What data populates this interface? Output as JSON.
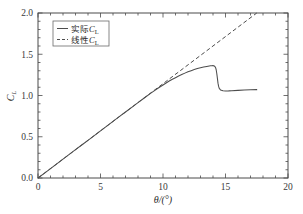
{
  "chart_data": {
    "type": "line",
    "title": "",
    "subtitle": "",
    "xlabel": "θ/(°)",
    "ylabel": "C",
    "ylabel_sub": "L",
    "xlim": [
      0,
      20
    ],
    "ylim": [
      0.0,
      2.0
    ],
    "xticks": [
      0,
      5,
      10,
      15,
      20
    ],
    "xticklabels": [
      "0",
      "5",
      "10",
      "15",
      "20"
    ],
    "yticks": [
      0.0,
      0.5,
      1.0,
      1.5,
      2.0
    ],
    "yticklabels": [
      "0.0",
      "0.5",
      "1.0",
      "1.5",
      "2.0"
    ],
    "x_minor_step": 1,
    "y_minor_step": 0.1,
    "grid": false,
    "legend_position": "upper-left",
    "series": [
      {
        "name": "实际C",
        "name_sub": "L",
        "style": "solid",
        "color": "#4d4d4d",
        "x": [
          0.0,
          0.5,
          1.0,
          1.5,
          2.0,
          2.5,
          3.0,
          3.5,
          4.0,
          4.5,
          5.0,
          5.5,
          6.0,
          6.5,
          7.0,
          7.5,
          8.0,
          8.5,
          9.0,
          9.5,
          10.0,
          10.25,
          10.5,
          10.75,
          11.0,
          11.25,
          11.5,
          11.75,
          12.0,
          12.25,
          12.5,
          12.75,
          13.0,
          13.25,
          13.5,
          13.6,
          13.7,
          13.8,
          13.9,
          14.0,
          14.1,
          14.2,
          14.25,
          14.3,
          14.35,
          14.4,
          14.45,
          14.5,
          14.6,
          14.8,
          15.0,
          15.25,
          15.5,
          16.0,
          16.5,
          17.0,
          17.5
        ],
        "y": [
          0.0,
          0.057,
          0.114,
          0.171,
          0.229,
          0.286,
          0.343,
          0.4,
          0.457,
          0.514,
          0.571,
          0.629,
          0.686,
          0.743,
          0.8,
          0.857,
          0.914,
          0.97,
          1.025,
          1.078,
          1.128,
          1.152,
          1.175,
          1.196,
          1.216,
          1.236,
          1.254,
          1.271,
          1.287,
          1.301,
          1.314,
          1.326,
          1.336,
          1.345,
          1.352,
          1.355,
          1.358,
          1.36,
          1.361,
          1.362,
          1.358,
          1.34,
          1.315,
          1.27,
          1.21,
          1.15,
          1.11,
          1.086,
          1.068,
          1.058,
          1.055,
          1.056,
          1.058,
          1.062,
          1.066,
          1.069,
          1.071
        ]
      },
      {
        "name": "线性C",
        "name_sub": "L",
        "style": "dashed",
        "color": "#4d4d4d",
        "x": [
          0.0,
          17.5
        ],
        "y": [
          0.0,
          2.0
        ]
      }
    ]
  },
  "legend": {
    "entries": [
      {
        "label_main": "实际",
        "label_var": "C",
        "label_sub": "L",
        "style": "solid"
      },
      {
        "label_main": "线性",
        "label_var": "C",
        "label_sub": "L",
        "style": "dashed"
      }
    ]
  },
  "axes": {
    "x_title": "θ/(°)",
    "y_title_var": "C",
    "y_title_sub": "L"
  }
}
